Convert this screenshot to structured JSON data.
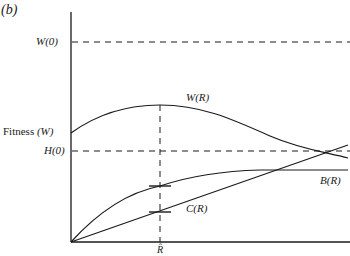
{
  "figure": {
    "panel_label": "(b)",
    "y_axis_label_text": "Fitness ",
    "y_axis_label_symbol": "(W)",
    "reference_lines": {
      "w0": "W(0)",
      "h0": "H(0)"
    },
    "curves": {
      "wr": "W(R)",
      "br": "B(R)",
      "cr": "C(R)"
    },
    "x_marker": "R̂",
    "colors": {
      "line": "#1a1a1a",
      "background": "#ffffff"
    }
  }
}
